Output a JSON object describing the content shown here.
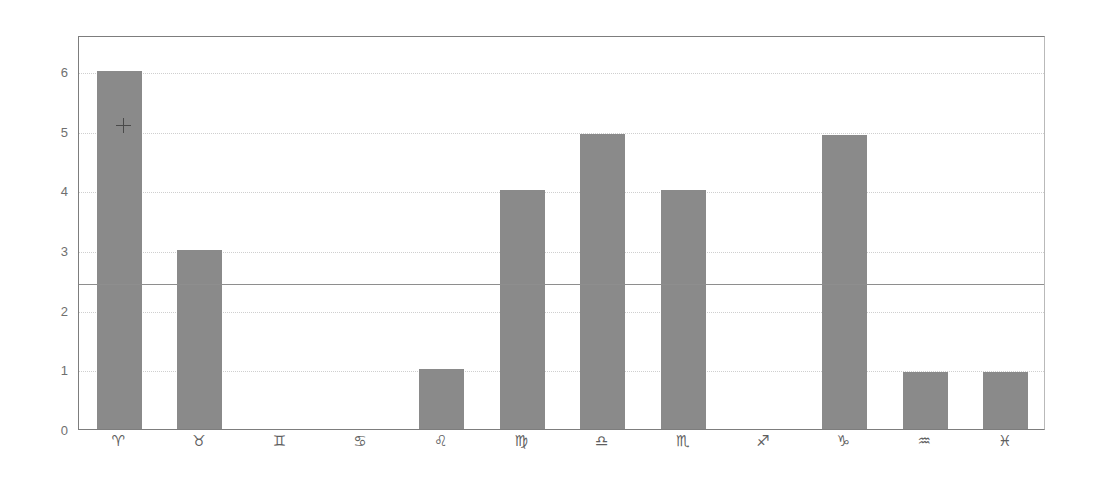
{
  "chart_data": {
    "type": "bar",
    "title": "",
    "subtitle": "",
    "xlabel": "",
    "ylabel": "",
    "categories": [
      "♈",
      "♉",
      "♊",
      "♋",
      "♌",
      "♍",
      "♎",
      "♏",
      "♐",
      "♑",
      "♒",
      "♓"
    ],
    "category_names": [
      "Aries",
      "Taurus",
      "Gemini",
      "Cancer",
      "Leo",
      "Virgo",
      "Libra",
      "Scorpio",
      "Sagittarius",
      "Capricorn",
      "Aquarius",
      "Pisces"
    ],
    "values": [
      6,
      3,
      0,
      0,
      1,
      4,
      4.95,
      4,
      0,
      4.92,
      0.95,
      0.95
    ],
    "ylim": [
      0,
      6.6
    ],
    "yticks": [
      0,
      1,
      2,
      3,
      4,
      5,
      6
    ],
    "ytick_labels": [
      "0",
      "1",
      "2",
      "3",
      "4",
      "5",
      "6"
    ],
    "grid": true,
    "grid_style": "dotted",
    "legend": "none",
    "reference_line": {
      "value": 2.47,
      "label": "",
      "style": "solid"
    },
    "bar_color": "#8a8a8a",
    "grid_color": "#cfcfcf",
    "axis_color": "#7d7d7d",
    "background_color": "#ffffff"
  },
  "annotations": {
    "cursor": {
      "name": "crosshair-cursor",
      "x_category": "♈",
      "x_px": 123,
      "y_px": 125
    }
  }
}
